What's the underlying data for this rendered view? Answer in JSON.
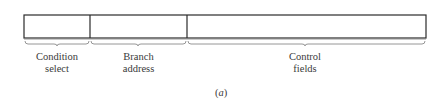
{
  "diagram": {
    "type": "microinstruction-format",
    "fields": [
      {
        "name": "Condition select",
        "line1": "Condition",
        "line2": "select",
        "x_start": 24,
        "x_end": 90
      },
      {
        "name": "Branch address",
        "line1": "Branch",
        "line2": "address",
        "x_start": 90,
        "x_end": 187
      },
      {
        "name": "Control fields",
        "line1": "Control",
        "line2": "fields",
        "x_start": 187,
        "x_end": 426
      }
    ],
    "caption_open": "(",
    "caption_letter": "a",
    "caption_close": ")",
    "stroke_color": "#2b2b2b",
    "brace_color": "#8a8a8a"
  }
}
